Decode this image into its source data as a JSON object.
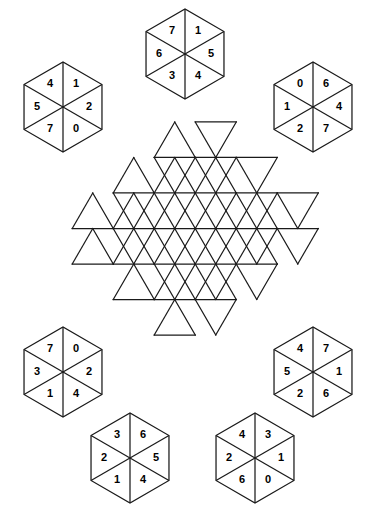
{
  "puzzle": {
    "type": "hexagon-tile-placement-puzzle",
    "canvas": {
      "width": 367,
      "height": 509,
      "background": "#ffffff"
    },
    "line_color": "#1a1a1a",
    "text_color": "#000000",
    "board": {
      "name": "hexagram-star-grid",
      "shape": "hexagram",
      "center": {
        "x": 185,
        "y": 228.5
      },
      "triangle_side": 41.0,
      "rows": 6,
      "total_cells": 54,
      "cells_filled": 0,
      "cell_labels": []
    },
    "pieces": [
      {
        "id": "piece-top-center",
        "position": "top-center",
        "center": {
          "x": 185,
          "y": 54
        },
        "radius": 45,
        "values": {
          "top": "1",
          "upper_right": "5",
          "lower_right": "4",
          "bottom": "3",
          "lower_left": "6",
          "upper_left": "7"
        },
        "clockwise_from_top": [
          "1",
          "5",
          "4",
          "3",
          "6",
          "7"
        ]
      },
      {
        "id": "piece-top-left",
        "position": "top-left",
        "center": {
          "x": 63,
          "y": 107
        },
        "radius": 45,
        "values": {
          "top": "1",
          "upper_right": "2",
          "lower_right": "0",
          "bottom": "7",
          "lower_left": "5",
          "upper_left": "4"
        },
        "clockwise_from_top": [
          "1",
          "2",
          "0",
          "7",
          "5",
          "4"
        ]
      },
      {
        "id": "piece-top-right",
        "position": "top-right",
        "center": {
          "x": 313,
          "y": 107
        },
        "radius": 45,
        "values": {
          "top": "6",
          "upper_right": "4",
          "lower_right": "7",
          "bottom": "2",
          "lower_left": "1",
          "upper_left": "0"
        },
        "clockwise_from_top": [
          "6",
          "4",
          "7",
          "2",
          "1",
          "0"
        ]
      },
      {
        "id": "piece-bottom-left",
        "position": "bottom-left",
        "center": {
          "x": 63,
          "y": 372
        },
        "radius": 45,
        "values": {
          "top": "0",
          "upper_right": "2",
          "lower_right": "4",
          "bottom": "1",
          "lower_left": "3",
          "upper_left": "7"
        },
        "clockwise_from_top": [
          "0",
          "2",
          "4",
          "1",
          "3",
          "7"
        ]
      },
      {
        "id": "piece-bottom-right",
        "position": "bottom-right",
        "center": {
          "x": 313,
          "y": 372
        },
        "radius": 45,
        "values": {
          "top": "7",
          "upper_right": "1",
          "lower_right": "6",
          "bottom": "2",
          "lower_left": "5",
          "upper_left": "4"
        },
        "clockwise_from_top": [
          "7",
          "1",
          "6",
          "2",
          "5",
          "4"
        ]
      },
      {
        "id": "piece-bottom-center-left",
        "position": "bottom-center-left",
        "center": {
          "x": 130,
          "y": 458
        },
        "radius": 45,
        "values": {
          "top": "6",
          "upper_right": "5",
          "lower_right": "4",
          "bottom": "1",
          "lower_left": "2",
          "upper_left": "3"
        },
        "clockwise_from_top": [
          "6",
          "5",
          "4",
          "1",
          "2",
          "3"
        ]
      },
      {
        "id": "piece-bottom-center-right",
        "position": "bottom-center-right",
        "center": {
          "x": 255,
          "y": 458
        },
        "radius": 45,
        "values": {
          "top": "3",
          "upper_right": "1",
          "lower_right": "0",
          "bottom": "6",
          "lower_left": "2",
          "upper_left": "4"
        },
        "clockwise_from_top": [
          "3",
          "1",
          "0",
          "6",
          "2",
          "4"
        ]
      }
    ]
  }
}
